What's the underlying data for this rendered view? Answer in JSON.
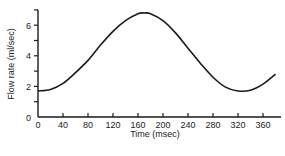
{
  "chart_data": {
    "type": "line",
    "title": "",
    "xlabel": "Time (msec)",
    "ylabel": "Flow rate (ml/sec)",
    "xlim": [
      0,
      380
    ],
    "ylim": [
      0,
      7
    ],
    "x_ticks": [
      0,
      40,
      80,
      120,
      160,
      200,
      240,
      280,
      320,
      360
    ],
    "y_ticks": [
      0,
      2,
      4,
      6
    ],
    "grid": false,
    "legend": null,
    "series": [
      {
        "name": "Flow rate",
        "x": [
          0,
          20,
          40,
          60,
          80,
          100,
          120,
          140,
          160,
          170,
          180,
          200,
          220,
          240,
          260,
          280,
          300,
          320,
          340,
          360,
          380
        ],
        "values": [
          1.7,
          1.8,
          2.2,
          2.9,
          3.7,
          4.7,
          5.6,
          6.3,
          6.75,
          6.8,
          6.75,
          6.3,
          5.5,
          4.5,
          3.5,
          2.6,
          1.95,
          1.7,
          1.75,
          2.15,
          2.8
        ]
      }
    ]
  }
}
